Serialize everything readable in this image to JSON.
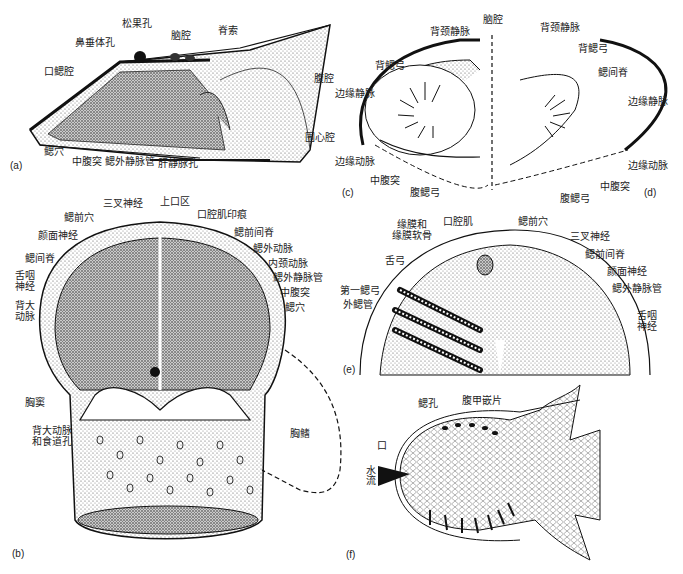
{
  "figure": {
    "panels": [
      {
        "id": "a",
        "label": "(a)",
        "view": "lateral section",
        "annotations": [
          "松果孔",
          "脑腔",
          "脊索",
          "鼻垂体孔",
          "口鳃腔",
          "腹腔",
          "围心腔",
          "鳃穴",
          "中腹突",
          "鳃外静脉管",
          "肝静脉孔"
        ]
      },
      {
        "id": "b",
        "label": "(b)",
        "view": "ventral view of head shield interior",
        "annotations": [
          "三叉神经",
          "上口区",
          "鳃前穴",
          "口腔肌印痕",
          "颜面神经",
          "鳃前间脊",
          "鳃外动脉",
          "鳃间脊",
          "内颈动脉",
          "舌咽神经",
          "鳃外静脉管",
          "中腹突",
          "背大动脉",
          "鳃穴",
          "胸窦",
          "背大动脉和食道孔",
          "胸鳍"
        ]
      },
      {
        "id": "c",
        "label": "(c)",
        "view": "transverse section (left)",
        "annotations": [
          "背颈静脉",
          "背鳃弓",
          "边缘静脉",
          "边缘动脉",
          "中腹突",
          "腹鳃弓"
        ]
      },
      {
        "id": "d",
        "label": "(d)",
        "view": "transverse section (right)",
        "annotations": [
          "脑腔",
          "背颈静脉",
          "背鳃弓",
          "鳃间脊",
          "边缘静脉",
          "边缘动脉",
          "中腹突",
          "腹鳃弓"
        ]
      },
      {
        "id": "e",
        "label": "(e)",
        "view": "reconstruction of gill region",
        "annotations": [
          "缘膜和缘膜软骨",
          "口腔肌",
          "鳃前穴",
          "三叉神经",
          "舌弓",
          "鳃前间脊",
          "颜面神经",
          "第一鳃弓",
          "外鳃管",
          "鳃外静脉管",
          "舌咽神经"
        ]
      },
      {
        "id": "f",
        "label": "(f)",
        "view": "ventral view with water flow",
        "annotations": [
          "鳃孔",
          "腹甲嵌片",
          "口",
          "水流"
        ]
      }
    ]
  },
  "labels": {
    "a": {
      "songguo": "松果孔",
      "naoqiang": "脑腔",
      "jisuo": "脊索",
      "bichui": "鼻垂体孔",
      "kousai": "口鳃腔",
      "fuqiang": "腹腔",
      "weixin": "围心腔",
      "saixue": "鳃穴",
      "zhongfu": "中腹突",
      "saiwaijing": "鳃外静脉管",
      "ganjing": "肝静脉孔",
      "panel": "(a)"
    },
    "b": {
      "sancha": "三叉神经",
      "shangkou": "上口区",
      "saiqianxue": "鳃前穴",
      "kouqiangji": "口腔肌印痕",
      "yanmian": "颜面神经",
      "saiqianjianji": "鳃前间脊",
      "saiwaidong": "鳃外动脉",
      "saijianji": "鳃间脊",
      "neijing": "内颈动脉",
      "sheyan": "舌咽\n神经",
      "saiwaijing": "鳃外静脉管",
      "zhongfu": "中腹突",
      "beida": "背大\n动脉",
      "saixue": "鳃穴",
      "xiongdou": "胸窦",
      "beidashidao": "背大动脉\n和食道孔",
      "xiongqi": "胸鳍",
      "panel": "(b)"
    },
    "c": {
      "beijing": "背颈静脉",
      "beisai": "背鳃弓",
      "bianjing": "边缘静脉",
      "biandong": "边缘动脉",
      "zhongfu": "中腹突",
      "fusai": "腹鳃弓",
      "panel": "(c)"
    },
    "d": {
      "naoqiang": "脑腔",
      "beijing": "背颈静脉",
      "beisai": "背鳃弓",
      "saijian": "鳃间脊",
      "bianjing": "边缘静脉",
      "biandong": "边缘动脉",
      "zhongfu": "中腹突",
      "fusai": "腹鳃弓",
      "panel": "(d)"
    },
    "e": {
      "yuanmo": "缘膜和\n缘膜软骨",
      "kouqiangji": "口腔肌",
      "saiqianxue": "鳃前穴",
      "sancha": "三叉神经",
      "shegong": "舌弓",
      "saiqianjianji": "鳃前间脊",
      "yanmian": "颜面神经",
      "diyi": "第一鳃弓",
      "waisaiguan": "外鳃管",
      "saiwaijing": "鳃外静脉管",
      "sheyan": "舌咽\n神经",
      "panel": "(e)"
    },
    "f": {
      "saikong": "鳃孔",
      "fujia": "腹甲嵌片",
      "kou": "口",
      "shuiliu": "水流",
      "panel": "(f)"
    }
  }
}
